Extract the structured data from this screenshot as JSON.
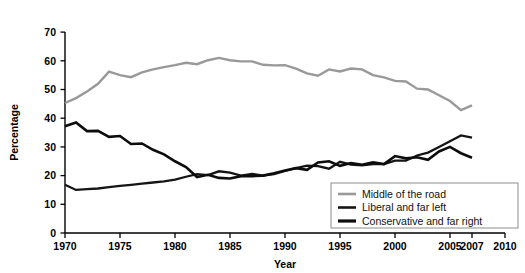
{
  "chart_data": {
    "type": "line",
    "title": "",
    "xlabel": "Year",
    "ylabel": "Percentage",
    "xlim": [
      1970,
      2010
    ],
    "ylim": [
      0,
      70
    ],
    "xticks": [
      1970,
      1975,
      1980,
      1985,
      1990,
      1995,
      2000,
      2005,
      2007,
      2010
    ],
    "yticks": [
      0,
      10,
      20,
      30,
      40,
      50,
      60,
      70
    ],
    "grid": false,
    "legend_position": "bottom-right",
    "x": [
      1970,
      1971,
      1972,
      1973,
      1974,
      1975,
      1976,
      1977,
      1978,
      1979,
      1980,
      1981,
      1982,
      1983,
      1984,
      1985,
      1986,
      1987,
      1988,
      1989,
      1990,
      1991,
      1992,
      1993,
      1994,
      1995,
      1996,
      1997,
      1998,
      1999,
      2000,
      2001,
      2002,
      2003,
      2004,
      2005,
      2006,
      2007
    ],
    "series": [
      {
        "name": "Middle of the road",
        "color": "#999999",
        "width": 2.4,
        "values": [
          45.3,
          47.0,
          49.3,
          52.0,
          56.2,
          55.0,
          54.3,
          56.0,
          57.0,
          57.8,
          58.5,
          59.3,
          58.8,
          60.2,
          61.0,
          60.2,
          59.8,
          59.8,
          58.6,
          58.4,
          58.5,
          57.3,
          55.6,
          54.8,
          57.0,
          56.3,
          57.3,
          57.0,
          55.0,
          54.2,
          53.0,
          52.8,
          50.3,
          50.0,
          48.0,
          46.0,
          42.8,
          44.5
        ]
      },
      {
        "name": "Liberal and far left",
        "color": "#151515",
        "width": 2.3,
        "values": [
          16.8,
          15.0,
          15.3,
          15.5,
          16.0,
          16.4,
          16.8,
          17.2,
          17.6,
          18.0,
          18.6,
          19.6,
          20.5,
          20.2,
          21.5,
          21.0,
          20.0,
          20.6,
          20.0,
          20.5,
          21.6,
          22.6,
          23.5,
          23.3,
          22.4,
          24.8,
          23.8,
          23.6,
          24.0,
          24.0,
          25.2,
          25.2,
          27.0,
          28.0,
          30.0,
          32.0,
          34.0,
          33.2
        ]
      },
      {
        "name": "Conservative and far right",
        "color": "#0d0d0d",
        "width": 2.6,
        "values": [
          37.2,
          38.5,
          35.5,
          35.6,
          33.5,
          33.8,
          31.0,
          31.2,
          29.0,
          27.4,
          25.0,
          23.0,
          19.5,
          20.3,
          19.2,
          19.0,
          19.8,
          19.8,
          20.0,
          20.8,
          21.8,
          22.6,
          22.0,
          24.6,
          25.0,
          23.4,
          24.4,
          23.8,
          24.6,
          24.0,
          26.8,
          26.0,
          26.4,
          25.5,
          28.4,
          30.0,
          27.8,
          26.2
        ]
      }
    ]
  },
  "axis": {
    "y_title": "Percentage",
    "x_title": "Year",
    "y_tick_labels": [
      "70",
      "60",
      "50",
      "40",
      "30",
      "20",
      "10",
      "0"
    ],
    "x_tick_labels": [
      "1970",
      "1975",
      "1980",
      "1985",
      "1990",
      "1995",
      "2000",
      "2005",
      "2007",
      "2010"
    ]
  },
  "legend": {
    "items": [
      {
        "label": "Middle of the road",
        "color": "#999999",
        "width": 2.6
      },
      {
        "label": "Liberal and far left",
        "color": "#151515",
        "width": 2.6
      },
      {
        "label": "Conservative and far right",
        "color": "#0d0d0d",
        "width": 3.2
      }
    ]
  }
}
